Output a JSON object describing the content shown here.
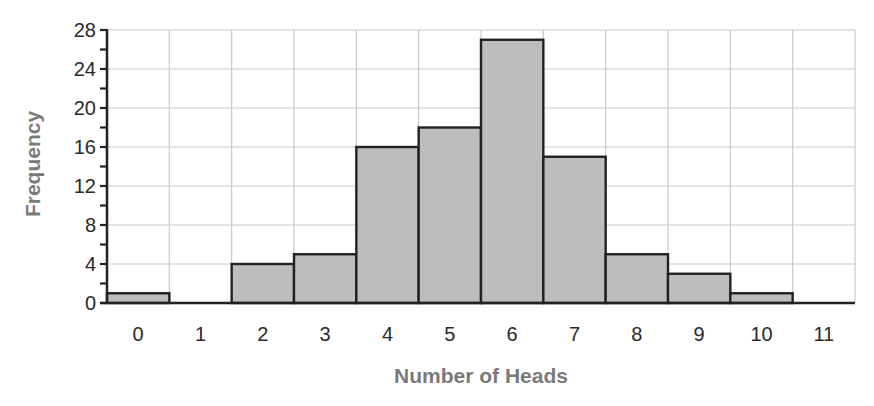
{
  "chart_data": {
    "type": "bar",
    "subtype": "histogram",
    "title": "",
    "xlabel": "Number of Heads",
    "ylabel": "Frequency",
    "categories": [
      "0",
      "1",
      "2",
      "3",
      "4",
      "5",
      "6",
      "7",
      "8",
      "9",
      "10",
      "11"
    ],
    "values": [
      1,
      0,
      4,
      5,
      16,
      18,
      27,
      15,
      5,
      3,
      1,
      0
    ],
    "ylim": [
      0,
      28
    ],
    "y_ticks": [
      0,
      4,
      8,
      12,
      16,
      20,
      24,
      28
    ],
    "y_minor_tick_step": 2,
    "grid": true,
    "legend": null,
    "colors": {
      "bar_fill": "#bdbdbd",
      "bar_edge": "#222222",
      "grid": "#c9c9c9",
      "axis": "#222222",
      "axis_title": "#7a7a7a",
      "tick_label": "#2a2a2a"
    }
  },
  "layout": {
    "plot_left": 107,
    "plot_right": 855,
    "plot_top": 30,
    "plot_bottom": 303
  }
}
